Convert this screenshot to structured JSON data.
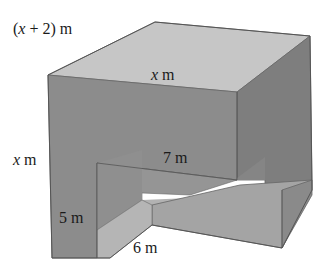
{
  "diagram": {
    "title": "",
    "type": "3D solid (box with rectangular notch removed)",
    "labels": {
      "depth": "(x + 2) m",
      "width": "x m",
      "height": "x m",
      "notch_depth": "7 m",
      "notch_height": "5 m",
      "notch_width": "6 m"
    },
    "label_parts": {
      "depth_var": "x",
      "depth_rest": " + 2) m",
      "depth_open": "(",
      "width_var": "x",
      "width_unit": " m",
      "height_var": "x",
      "height_unit": " m"
    },
    "colors": {
      "top_face": "#c4c4c4",
      "front_face": "#8a8a8a",
      "right_face": "#7c7c7c",
      "notch_back": "#9a9a9a",
      "notch_side": "#b0b0b0",
      "notch_floor_front": "#a2a2a2",
      "edge": "#555555",
      "text": "#1a1a1a"
    }
  }
}
